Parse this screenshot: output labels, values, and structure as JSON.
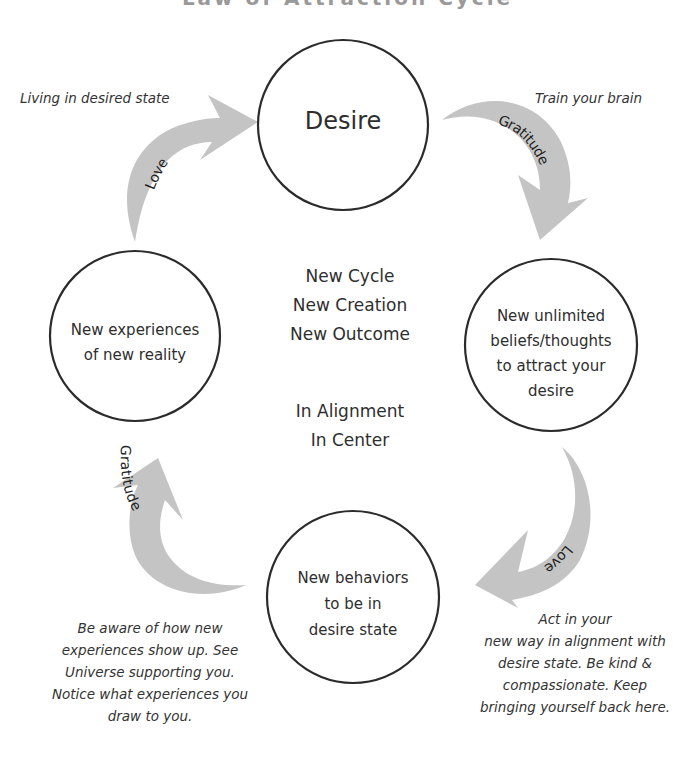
{
  "title": "Law of Attraction Cycle",
  "nodes": {
    "desire": {
      "label": "Desire"
    },
    "beliefs": {
      "lines": [
        "New unlimited",
        "beliefs/thoughts",
        "to attract your",
        "desire"
      ]
    },
    "behaviors": {
      "lines": [
        "New behaviors",
        "to be in",
        "desire state"
      ]
    },
    "experiences": {
      "lines": [
        "New experiences",
        "of new reality"
      ]
    }
  },
  "center": {
    "group1": [
      "New Cycle",
      "New Creation",
      "New Outcome"
    ],
    "group2": [
      "In Alignment",
      "In Center"
    ]
  },
  "arrows": {
    "top_right": {
      "label": "Gratitude",
      "icon": "curved-arrow-icon"
    },
    "bottom_right": {
      "label": "Love",
      "icon": "curved-arrow-icon"
    },
    "bottom_left": {
      "label": "Gratitude",
      "icon": "curved-arrow-icon"
    },
    "top_left": {
      "label": "Love",
      "icon": "curved-arrow-icon"
    }
  },
  "notes": {
    "top_left": [
      "Living in desired state"
    ],
    "top_right": [
      "Train your brain"
    ],
    "bottom_right": [
      "Act in your",
      "new way  in alignment with",
      "desire state. Be kind &",
      "compassionate. Keep",
      "bringing yourself back here."
    ],
    "bottom_left": [
      "Be aware of how new",
      "experiences show up. See",
      "Universe supporting you.",
      "Notice what experiences you",
      "draw to you."
    ]
  },
  "colors": {
    "arrow_fill": "#c4c4c4",
    "circle_stroke": "#2b2b2b",
    "text": "#2e2e2e"
  }
}
